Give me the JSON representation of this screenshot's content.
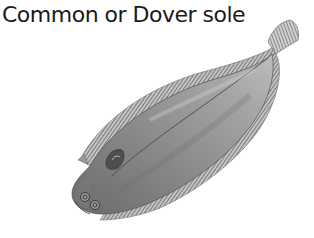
{
  "title": "Common or Dover sole",
  "illustration": {
    "subject": "Common or Dover sole fish",
    "style": "grayscale pencil drawing",
    "colors": {
      "body_light": "#b0b0b0",
      "body_mid": "#8a8a8a",
      "body_dark": "#5a5a5a",
      "fin_edge": "#6e6e6e",
      "background": "#ffffff"
    }
  }
}
